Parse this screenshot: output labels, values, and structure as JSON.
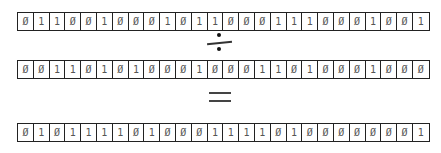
{
  "diagram": {
    "dividend": [
      0,
      1,
      1,
      0,
      0,
      1,
      0,
      0,
      0,
      1,
      0,
      1,
      1,
      0,
      0,
      0,
      1,
      1,
      1,
      0,
      0,
      0,
      1,
      0,
      0,
      1
    ],
    "operator": "÷",
    "divisor": [
      0,
      0,
      1,
      1,
      0,
      1,
      0,
      1,
      0,
      0,
      0,
      1,
      0,
      0,
      0,
      1,
      1,
      0,
      1,
      0,
      0,
      0,
      1,
      0,
      0,
      0
    ],
    "equals": "=",
    "result": [
      0,
      1,
      0,
      1,
      1,
      1,
      1,
      0,
      1,
      0,
      0,
      0,
      1,
      1,
      1,
      1,
      0,
      1,
      0,
      0,
      0,
      0,
      0,
      0,
      0,
      1
    ],
    "zero_glyph": "Ø",
    "one_glyph": "1"
  }
}
